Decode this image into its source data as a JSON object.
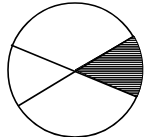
{
  "diagram": {
    "type": "circle-sectors",
    "shape": "circle divided by two chords through the center",
    "sectors": [
      {
        "id": "right",
        "shaded": true,
        "pattern": "horizontal-hatch"
      },
      {
        "id": "top",
        "shaded": false
      },
      {
        "id": "left",
        "shaded": false
      },
      {
        "id": "bottom",
        "shaded": false
      }
    ],
    "colors": {
      "stroke": "#000000",
      "fill": "#ffffff",
      "hatch": "#000000"
    }
  }
}
